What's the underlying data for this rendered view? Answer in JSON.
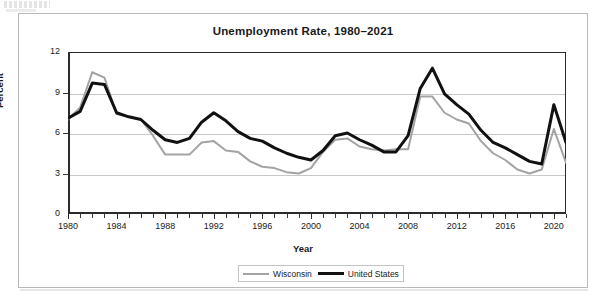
{
  "chart_data": {
    "type": "line",
    "title": "Unemployment Rate, 1980–2021",
    "xlabel": "Year",
    "ylabel": "Percent",
    "ylim": [
      0,
      12
    ],
    "yticks": [
      0,
      3,
      6,
      9,
      12
    ],
    "xlim": [
      1980,
      2021
    ],
    "xticks": [
      1980,
      1984,
      1988,
      1992,
      1996,
      2000,
      2004,
      2008,
      2012,
      2016,
      2020
    ],
    "grid": true,
    "legend_position": "bottom-center",
    "x": [
      1980,
      1981,
      1982,
      1983,
      1984,
      1985,
      1986,
      1987,
      1988,
      1989,
      1990,
      1991,
      1992,
      1993,
      1994,
      1995,
      1996,
      1997,
      1998,
      1999,
      2000,
      2001,
      2002,
      2003,
      2004,
      2005,
      2006,
      2007,
      2008,
      2009,
      2010,
      2011,
      2012,
      2013,
      2014,
      2015,
      2016,
      2017,
      2018,
      2019,
      2020,
      2021
    ],
    "series": [
      {
        "name": "Wisconsin",
        "color": "#a3a3a3",
        "width": 2,
        "values": [
          7.0,
          7.9,
          10.5,
          10.1,
          7.4,
          7.2,
          7.0,
          5.8,
          4.4,
          4.4,
          4.4,
          5.3,
          5.4,
          4.7,
          4.6,
          3.9,
          3.5,
          3.4,
          3.1,
          3.0,
          3.4,
          4.6,
          5.5,
          5.6,
          5.0,
          4.8,
          4.7,
          4.8,
          4.8,
          8.7,
          8.7,
          7.5,
          7.0,
          6.7,
          5.4,
          4.5,
          4.0,
          3.3,
          3.0,
          3.3,
          6.3,
          3.8
        ]
      },
      {
        "name": "United States",
        "color": "#111111",
        "width": 3,
        "values": [
          7.1,
          7.6,
          9.7,
          9.6,
          7.5,
          7.2,
          7.0,
          6.2,
          5.5,
          5.3,
          5.6,
          6.8,
          7.5,
          6.9,
          6.1,
          5.6,
          5.4,
          4.9,
          4.5,
          4.2,
          4.0,
          4.7,
          5.8,
          6.0,
          5.5,
          5.1,
          4.6,
          4.6,
          5.8,
          9.3,
          10.8,
          8.9,
          8.1,
          7.4,
          6.2,
          5.3,
          4.9,
          4.4,
          3.9,
          3.7,
          8.1,
          5.3
        ]
      }
    ]
  },
  "legend": {
    "items": [
      {
        "label": "Wisconsin"
      },
      {
        "label": "United States"
      }
    ]
  }
}
